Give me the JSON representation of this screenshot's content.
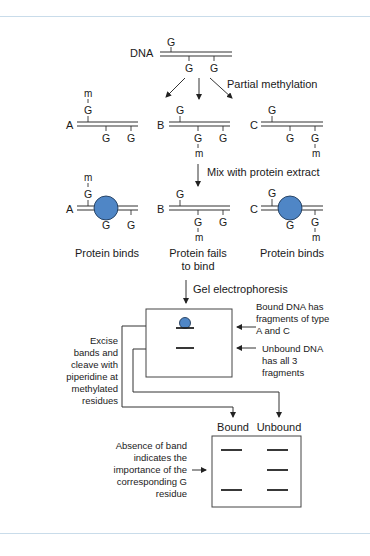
{
  "frame": {
    "rule_color": "#c9dcea",
    "top_rule_y": 16,
    "bottom_rule_y": 533
  },
  "colors": {
    "protein": "#4f86c6",
    "line": "#333333"
  },
  "dna": {
    "label": "DNA",
    "top_g": "G",
    "bottom_g1": "G",
    "bottom_g2": "G"
  },
  "steps": {
    "methylation": "Partial methylation",
    "mix": "Mix with protein extract",
    "gel": "Gel electrophoresis"
  },
  "fragments": {
    "A": {
      "label": "A",
      "g": "G",
      "m": "m"
    },
    "B": {
      "label": "B",
      "g": "G",
      "m": "m"
    },
    "C": {
      "label": "C",
      "g": "G",
      "m": "m"
    }
  },
  "outcomes": {
    "A": "Protein binds",
    "B_line1": "Protein fails",
    "B_line2": "to bind",
    "C": "Protein binds"
  },
  "gel1": {
    "note_bound": [
      "Bound DNA has",
      "fragments of type",
      "A and C"
    ],
    "note_unbound": [
      "Unbound DNA",
      "has all 3",
      "fragments"
    ]
  },
  "excise_note": [
    "Excise",
    "bands and",
    "cleave with",
    "piperidine at",
    "methylated",
    "residues"
  ],
  "gel2": {
    "lane_bound": "Bound",
    "lane_unbound": "Unbound",
    "note": [
      "Absence of band",
      "indicates the",
      "importance of the",
      "corresponding G",
      "residue"
    ]
  }
}
